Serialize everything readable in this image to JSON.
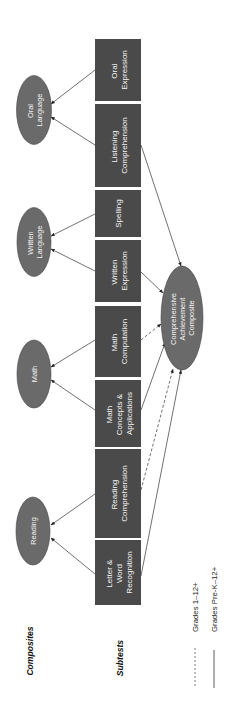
{
  "row_labels": {
    "composites": "Composites",
    "subtests": "Subtests"
  },
  "composites": [
    {
      "id": "oral-language",
      "lines": [
        "Oral",
        "Language"
      ]
    },
    {
      "id": "written-language",
      "lines": [
        "Written",
        "Language"
      ]
    },
    {
      "id": "math",
      "lines": [
        "Math"
      ]
    },
    {
      "id": "reading",
      "lines": [
        "Reading"
      ]
    }
  ],
  "overall_composite": {
    "id": "comprehensive-achievement-composite",
    "lines": [
      "Comprehensive",
      "Achievement",
      "Composite"
    ]
  },
  "subtests": [
    {
      "id": "oral-expression",
      "lines": [
        "Oral",
        "Expression"
      ],
      "composite": "oral-language",
      "to_overall": "none"
    },
    {
      "id": "listening-comprehension",
      "lines": [
        "Listening",
        "Comprehension"
      ],
      "composite": "oral-language",
      "to_overall": "solid"
    },
    {
      "id": "spelling",
      "lines": [
        "Spelling"
      ],
      "composite": "written-language",
      "to_overall": "none"
    },
    {
      "id": "written-expression",
      "lines": [
        "Written",
        "Expression"
      ],
      "composite": "written-language",
      "to_overall": "solid"
    },
    {
      "id": "math-computation",
      "lines": [
        "Math",
        "Computation"
      ],
      "composite": "math",
      "to_overall": "dashed"
    },
    {
      "id": "math-concepts-applications",
      "lines": [
        "Math",
        "Concepts &",
        "Applications"
      ],
      "composite": "math",
      "to_overall": "solid"
    },
    {
      "id": "reading-comprehension",
      "lines": [
        "Reading",
        "Comprehension"
      ],
      "composite": "reading",
      "to_overall": "dashed"
    },
    {
      "id": "letter-word-recognition",
      "lines": [
        "Letter &",
        "Word",
        "Recognition"
      ],
      "composite": "reading",
      "to_overall": "solid"
    }
  ],
  "legend": {
    "dashed": "Grades 1–12+",
    "solid": "Grades Pre-K–12+"
  },
  "colors": {
    "box_fill": "#4a4a4a",
    "ellipse_fill": "#6a6a6a",
    "ellipse_stroke": "#444444",
    "line": "#333333"
  }
}
